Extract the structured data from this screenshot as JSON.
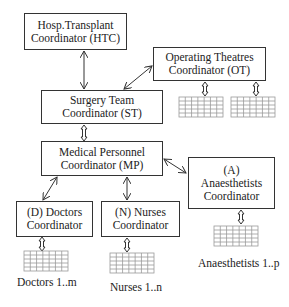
{
  "nodes": {
    "htc": {
      "line1": "Hosp.Transplant",
      "line2": "Coordinator (HTC)"
    },
    "ot": {
      "line1": "Operating Theatres",
      "line2": "Coordinator (OT)"
    },
    "st": {
      "line1": "Surgery Team",
      "line2": "Coordinator (ST)"
    },
    "mp": {
      "line1": "Medical Personnel",
      "line2": "Coordinator (MP)"
    },
    "a": {
      "line1": "(A)",
      "line2": "Anaesthetists",
      "line3": "Coordinator"
    },
    "d": {
      "line1": "(D) Doctors",
      "line2": "Coordinator"
    },
    "n": {
      "line1": "(N) Nurses",
      "line2": "Coordinator"
    }
  },
  "labels": {
    "doctors": "Doctors 1..m",
    "nurses": "Nurses 1..n",
    "anaesthetists": "Anaesthetists 1..p"
  },
  "edges": [
    {
      "from": "htc",
      "to": "st",
      "type": "bidirectional"
    },
    {
      "from": "st",
      "to": "ot",
      "type": "bidirectional"
    },
    {
      "from": "st",
      "to": "mp",
      "type": "bidirectional-block"
    },
    {
      "from": "mp",
      "to": "a",
      "type": "bidirectional"
    },
    {
      "from": "mp",
      "to": "d",
      "type": "bidirectional"
    },
    {
      "from": "mp",
      "to": "n",
      "type": "bidirectional"
    },
    {
      "from": "ot",
      "to": "ot-table-1",
      "type": "bidirectional-block"
    },
    {
      "from": "ot",
      "to": "ot-table-2",
      "type": "bidirectional-block"
    },
    {
      "from": "d",
      "to": "doctors-table",
      "type": "bidirectional-block"
    },
    {
      "from": "n",
      "to": "nurses-table",
      "type": "bidirectional-block"
    },
    {
      "from": "a",
      "to": "anaesthetists-table",
      "type": "bidirectional-block"
    }
  ],
  "colors": {
    "line": "#333333",
    "grid": "#888888",
    "background": "#ffffff"
  }
}
